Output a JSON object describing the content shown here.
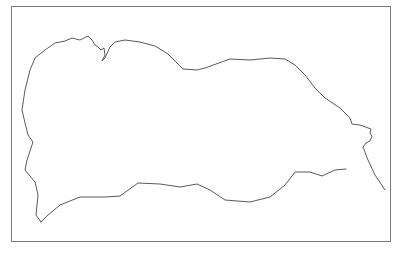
{
  "drawing": {
    "frame": {
      "x": 11,
      "y": 6,
      "width": 379,
      "height": 235,
      "stroke": "#7a7a7a"
    },
    "outline_color": "#5a5a5a",
    "outline_paths": [
      "M41,222 L36,215 L38,195 L35,182 L25,170 L27,160 L33,142 L28,135 L25,123 L22,110 L25,90 L30,70 L35,58 L45,50 L55,43 L65,41 L72,38 L80,40 L88,36 L92,40 L95,45 L98,47 L101,50 L104,48 L105,55 L102,61 L105,58 L110,47 L115,42 L125,40 L140,42 L155,46 L168,54 L183,69 L197,70 L205,68 L230,59 L250,60 L270,58 L285,59 L295,65 L305,75 L315,88 L325,98 L340,108 L350,118 L352,124 L360,125 L371,129 L370,133 L372,136 L370,141 L366,143 L363,147 L368,160 L375,175 L385,190",
      "M41,222 L48,215 L60,205 L80,197 L105,197 L120,196 L138,183 L160,184 L180,187 L197,184 L210,190 L225,200 L250,202 L270,197 L285,185 L295,172 L310,172 L322,176 L335,170 L346,169"
    ]
  }
}
